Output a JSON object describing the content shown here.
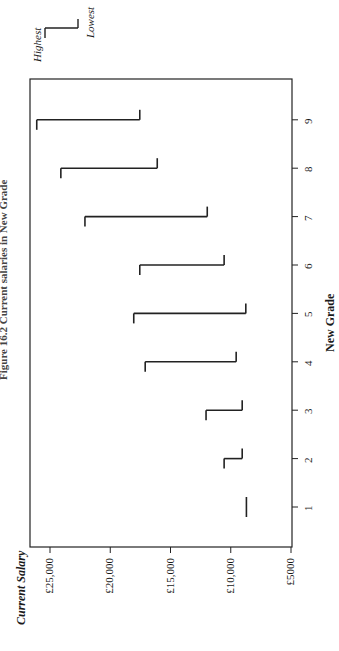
{
  "caption": "Figure 16.2  Current salaries in New Grade",
  "chart_data": {
    "type": "range",
    "title": "Current salaries in New Grade",
    "xlabel": "New Grade",
    "ylabel": "Current Salary",
    "categories": [
      "1",
      "2",
      "3",
      "4",
      "5",
      "6",
      "7",
      "8",
      "9"
    ],
    "series": [
      {
        "name": "Highest",
        "values": [
          8700,
          10550,
          12050,
          17100,
          18050,
          17550,
          22100,
          24100,
          26100
        ]
      },
      {
        "name": "Lowest",
        "values": [
          8700,
          9050,
          9050,
          9550,
          8750,
          10550,
          11950,
          16100,
          17550
        ]
      }
    ],
    "ylim": [
      5000,
      26650
    ],
    "yticks": [
      5000,
      10000,
      15000,
      20000,
      25000
    ],
    "ytick_labels": [
      "£5000",
      "£10,000",
      "£15,000",
      "£20,000",
      "£25,000"
    ],
    "legend": {
      "entries": [
        "Highest",
        "Lowest"
      ],
      "position": "top-right"
    },
    "grid": false,
    "orientation": "rotated 90° in page"
  },
  "legend": {
    "highest": "Highest",
    "lowest": "Lowest"
  },
  "axes": {
    "xlabel": "New Grade",
    "ylabel": "Current Salary"
  }
}
